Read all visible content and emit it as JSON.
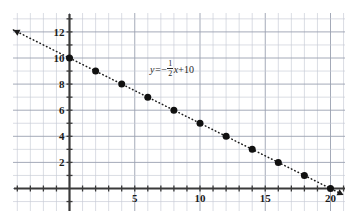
{
  "figure": {
    "kind": "coordinate-grid-line-graph",
    "background_color": "#ffffff",
    "grid_color": "#9aa0b0",
    "grid_minor_color": "#c6cad6",
    "axis_color": "#3a3a3a",
    "line_color": "#1a1a1a",
    "point_color": "#111111"
  },
  "equation": {
    "lhs": "y=",
    "minus": "−",
    "numerator": "1",
    "denominator": "2",
    "variable": "x",
    "plus": "+",
    "constant": "10",
    "full_text": "y = -1/2 x + 10"
  },
  "axes": {
    "x_tick_labels": [
      "5",
      "10",
      "15",
      "20"
    ],
    "x_tick_values": [
      5,
      10,
      15,
      20
    ],
    "y_tick_labels": [
      "2",
      "4",
      "6",
      "8",
      "10",
      "12"
    ],
    "y_tick_values": [
      2,
      4,
      6,
      8,
      10,
      12
    ],
    "x_range": [
      -5,
      21.5
    ],
    "y_range": [
      -1.5,
      13.2
    ],
    "grid_step": 1,
    "grid": true
  },
  "chart_data": {
    "type": "line",
    "title": "",
    "xlabel": "",
    "ylabel": "",
    "xlim": [
      -5,
      21.5
    ],
    "ylim": [
      -1.5,
      13.2
    ],
    "grid": true,
    "legend": "none",
    "annotations": [
      {
        "text": "y = -1/2 x + 10",
        "x": 7.0,
        "y": 8.6
      }
    ],
    "series": [
      {
        "name": "y = -1/2 x + 10",
        "style": "dotted",
        "marker": "filled-circle",
        "arrow_start": true,
        "arrow_end": true,
        "x": [
          0,
          2,
          4,
          6,
          8,
          10,
          12,
          14,
          16,
          18,
          20
        ],
        "y": [
          10,
          9,
          8,
          7,
          6,
          5,
          4,
          3,
          2,
          1,
          0
        ],
        "line_x": [
          -4.3,
          21.0
        ],
        "line_y": [
          12.15,
          -0.5
        ]
      }
    ]
  }
}
